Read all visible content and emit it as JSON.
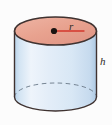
{
  "figure": {
    "type": "geometry-solid-diagram",
    "background_color": "#fcfcfc",
    "width": 112,
    "height": 125
  },
  "labels": {
    "radius": "r",
    "height": "h"
  },
  "colors": {
    "top_face_fill": "#e8a28f",
    "top_face_fill_light": "#edb3a3",
    "body_fill_light": "#eaf2fa",
    "body_fill_mid": "#dce9f6",
    "body_fill_edge": "#b9d3ea",
    "outline": "#3f3230",
    "radius_line": "#d4372c",
    "center_dot": "#1a1412",
    "hidden_edge": "#6f7d8c"
  },
  "geometry": {
    "center_x": 55.5,
    "top_ellipse_cy": 31,
    "bottom_ellipse_cy": 97,
    "rx": 41,
    "ry": 14,
    "radius_marker": {
      "from_x": 54,
      "from_y": 31,
      "to_x": 84,
      "to_y": 31
    },
    "center_dot_radius": 3
  },
  "parts": [
    {
      "name": "top-face",
      "description": "Elliptical top face of cylinder, shaded salmon"
    },
    {
      "name": "lateral-surface",
      "description": "Curved side wall of cylinder, shaded light blue"
    },
    {
      "name": "bottom-front-edge",
      "description": "Solid front arc of the base"
    },
    {
      "name": "bottom-hidden-edge",
      "description": "Dashed back arc of the base"
    },
    {
      "name": "radius-segment",
      "description": "Red line from center of top face to its rim"
    },
    {
      "name": "height-marker",
      "description": "Height label beside right wall"
    }
  ]
}
